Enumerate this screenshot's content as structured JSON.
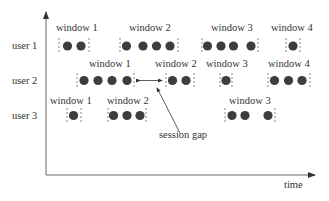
{
  "diagram": {
    "type": "session-window timeline",
    "axes": {
      "x_label": "time",
      "y_axis": "users"
    },
    "annotation": {
      "label": "session gap"
    },
    "rows": [
      {
        "user": "user 1",
        "windows": [
          {
            "label": "window 1",
            "events": 2
          },
          {
            "label": "window 2",
            "events": 4
          },
          {
            "label": "window 3",
            "events": 4
          },
          {
            "label": "window 4",
            "events": 1
          }
        ]
      },
      {
        "user": "user 2",
        "windows": [
          {
            "label": "window 1",
            "events": 4
          },
          {
            "label": "window 2",
            "events": 2
          },
          {
            "label": "window 3",
            "events": 1
          },
          {
            "label": "window 4",
            "events": 3
          }
        ]
      },
      {
        "user": "user 3",
        "windows": [
          {
            "label": "window 1",
            "events": 1
          },
          {
            "label": "window 2",
            "events": 3
          },
          {
            "label": "window 3",
            "events": 3
          }
        ]
      }
    ],
    "colors": {
      "dot": "#3a3a3a",
      "axis": "#555555",
      "text": "#333333"
    }
  }
}
